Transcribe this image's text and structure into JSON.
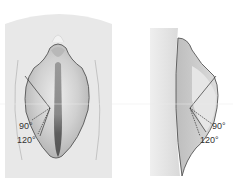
{
  "figure": {
    "left_view": {
      "name": "frontal view",
      "labels": [
        {
          "text": "90°",
          "x": 19,
          "y": 122
        },
        {
          "text": "120°",
          "x": 17,
          "y": 136
        }
      ]
    },
    "right_view": {
      "name": "lateral view",
      "labels": [
        {
          "text": "90°",
          "x": 212,
          "y": 122
        },
        {
          "text": "120°",
          "x": 200,
          "y": 136
        }
      ]
    },
    "colors": {
      "background_skin": "#e6e6e6",
      "outline": "#555555",
      "inner_shade": "#bdbdbd",
      "dark_center": "#6e6e6e",
      "line": "#333333"
    }
  }
}
